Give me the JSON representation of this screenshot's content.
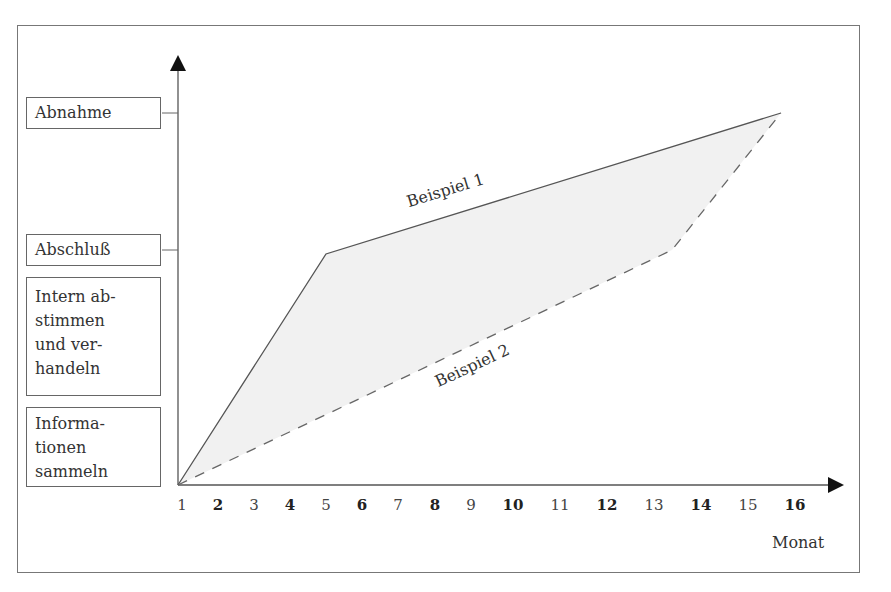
{
  "diagram": {
    "type": "process-timeline",
    "y_axis_stages": [
      {
        "label": "Abnahme",
        "lines": [
          "Abnahme"
        ]
      },
      {
        "label": "Abschluß",
        "lines": [
          "Abschluß"
        ]
      },
      {
        "label": "Intern abstimmen und verhandeln",
        "lines": [
          "Intern ab-",
          "stimmen",
          "und ver-",
          "handeln"
        ]
      },
      {
        "label": "Informationen sammeln",
        "lines": [
          "Informa-",
          "tionen",
          "sammeln"
        ]
      }
    ],
    "x_axis": {
      "label": "Monat",
      "ticks": [
        {
          "value": "1",
          "bold": false
        },
        {
          "value": "2",
          "bold": true
        },
        {
          "value": "3",
          "bold": false
        },
        {
          "value": "4",
          "bold": true
        },
        {
          "value": "5",
          "bold": false
        },
        {
          "value": "6",
          "bold": true
        },
        {
          "value": "7",
          "bold": false
        },
        {
          "value": "8",
          "bold": true
        },
        {
          "value": "9",
          "bold": false
        },
        {
          "value": "10",
          "bold": true
        },
        {
          "value": "11",
          "bold": false
        },
        {
          "value": "12",
          "bold": true
        },
        {
          "value": "13",
          "bold": false
        },
        {
          "value": "14",
          "bold": true
        },
        {
          "value": "15",
          "bold": false
        },
        {
          "value": "16",
          "bold": true
        }
      ]
    },
    "series": [
      {
        "name": "Beispiel 1",
        "style": "solid",
        "points": [
          [
            "1",
            "Start"
          ],
          [
            "5",
            "Abschluß"
          ],
          [
            "15.7",
            "Abnahme"
          ]
        ]
      },
      {
        "name": "Beispiel 2",
        "style": "dashed",
        "points": [
          [
            "1",
            "Start"
          ],
          [
            "13.4",
            "Abschluß"
          ],
          [
            "15.7",
            "Abnahme"
          ]
        ]
      }
    ],
    "fill_between_series": "#f1f1f1"
  }
}
